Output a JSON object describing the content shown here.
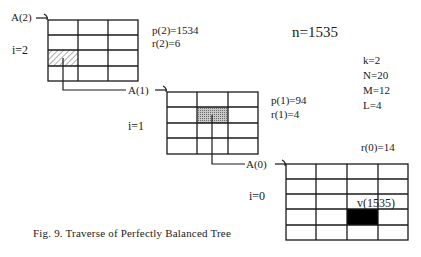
{
  "figure": {
    "caption": "Fig. 9.   Traverse of Perfectly Balanced Tree",
    "n_label": "n=1535",
    "params": [
      "k=2",
      "N=20",
      "M=12",
      "L=4"
    ]
  },
  "levels": [
    {
      "array_label": "A(2)",
      "index_label": "i=2",
      "p_label": "p(2)=1534",
      "r_label": "r(2)=6",
      "grid": {
        "cols": 3,
        "rows": 4,
        "marked_cell": {
          "row": 2,
          "col": 0,
          "style": "hatched"
        }
      }
    },
    {
      "array_label": "A(1)",
      "index_label": "i=1",
      "p_label": "p(1)=94",
      "r_label": "r(1)=4",
      "grid": {
        "cols": 3,
        "rows": 4,
        "marked_cell": {
          "row": 1,
          "col": 1,
          "style": "dotted-gray"
        }
      }
    },
    {
      "array_label": "A(0)",
      "index_label": "i=0",
      "r_label": "r(0)=14",
      "value_label": "v(1535)",
      "grid": {
        "cols": 4,
        "rows": 5,
        "marked_cell": {
          "row": 3,
          "col": 2,
          "style": "black"
        }
      }
    }
  ],
  "colors": {
    "line": "#1a1a1a",
    "hatch": "#9a9a9a",
    "dotted_fill": "#a8a8a8",
    "solid_fill": "#000000"
  }
}
